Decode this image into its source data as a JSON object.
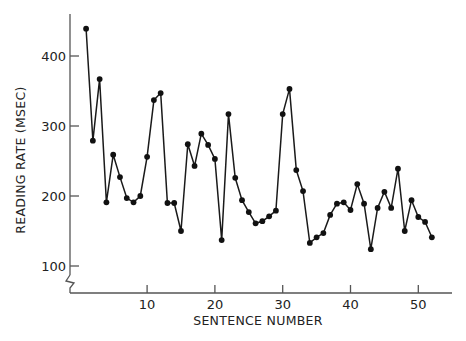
{
  "chart_data": {
    "type": "line",
    "title": "",
    "xlabel": "SENTENCE NUMBER",
    "ylabel": "READING RATE (MSEC)",
    "xlim": [
      0,
      54
    ],
    "ylim": [
      100,
      450
    ],
    "y_axis_break": true,
    "grid": false,
    "legend": null,
    "x_ticks": [
      10,
      20,
      30,
      40,
      50
    ],
    "x_tick_labels": [
      "10",
      "20",
      "30",
      "40",
      "50"
    ],
    "y_ticks": [
      100,
      200,
      300,
      400
    ],
    "y_tick_labels": [
      "100",
      "200",
      "300",
      "400"
    ],
    "series": [
      {
        "name": "Reading rate",
        "marker": "circle",
        "x": [
          1,
          2,
          3,
          4,
          5,
          6,
          7,
          8,
          9,
          10,
          11,
          12,
          13,
          14,
          15,
          16,
          17,
          18,
          19,
          20,
          21,
          22,
          23,
          24,
          25,
          26,
          27,
          28,
          29,
          30,
          31,
          32,
          33,
          34,
          35,
          36,
          37,
          38,
          39,
          40,
          41,
          42,
          43,
          44,
          45,
          46,
          47,
          48,
          49,
          50,
          51,
          52
        ],
        "values": [
          439,
          279,
          367,
          191,
          259,
          227,
          197,
          191,
          200,
          256,
          337,
          347,
          190,
          190,
          150,
          274,
          243,
          289,
          273,
          253,
          137,
          317,
          226,
          194,
          177,
          161,
          164,
          171,
          179,
          317,
          353,
          237,
          207,
          133,
          141,
          147,
          173,
          189,
          191,
          180,
          217,
          189,
          124,
          183,
          206,
          183,
          239,
          150,
          194,
          170,
          163,
          141
        ]
      }
    ]
  }
}
